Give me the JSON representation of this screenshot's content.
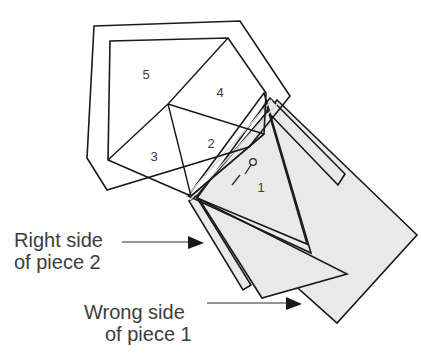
{
  "figure": {
    "background_color": "#ffffff",
    "line_color": "#1a1a1a",
    "shade_color": "#e9e9e9",
    "ghost_line_color": "#d8d8d8",
    "text_color": "#3c3c3c"
  },
  "pieces": [
    {
      "id": "piece-1",
      "label": "1",
      "x": 259,
      "y": 188
    },
    {
      "id": "piece-2",
      "label": "2",
      "x": 210,
      "y": 143
    },
    {
      "id": "piece-3",
      "label": "3",
      "x": 154,
      "y": 156
    },
    {
      "id": "piece-4",
      "label": "4",
      "x": 220,
      "y": 92
    },
    {
      "id": "piece-5",
      "label": "5",
      "x": 146,
      "y": 74
    }
  ],
  "callouts": [
    {
      "id": "callout-right-side",
      "line1": "Right side",
      "line2": "of piece 2",
      "text_x": 14,
      "line1_y": 241,
      "line2_y": 263,
      "leader_x1": 120,
      "leader_x2": 187,
      "leader_y": 243,
      "arrow_tip_x": 201,
      "arrow_tip_y": 243
    },
    {
      "id": "callout-wrong-side",
      "line1": "Wrong side",
      "line2": "of piece 1",
      "text_x": 84,
      "line1_y": 313,
      "line2_y": 335,
      "leader_x1": 205,
      "leader_x2": 285,
      "leader_y": 304,
      "arrow_tip_x": 299,
      "arrow_tip_y": 304
    }
  ],
  "markers": {
    "pin": {
      "id": "pin-marker",
      "cx": 253,
      "cy": 163,
      "r": 3.4,
      "stem_x2": 245,
      "stem_y2": 173
    },
    "tick": {
      "id": "tick-marker",
      "x1": 232,
      "y1": 184,
      "x2": 239,
      "y2": 175
    }
  },
  "shapes": {
    "outer_pentagon": "M 96,28 L 243,22 L 290,95 L 290,95 L 248,146 L 107,189 L 88,159 Z",
    "inner_pentagon": "M 109,40 L 232,37 L 278,103 L 237,158 L 108,161 Z",
    "shaded_quad": "M 271,100 L 340,163 L 372,300 L 296,330 L 227,203 Z",
    "shaded_strip": "M 268,98 L 345,176 L 338,186 L 262,106 Z"
  }
}
